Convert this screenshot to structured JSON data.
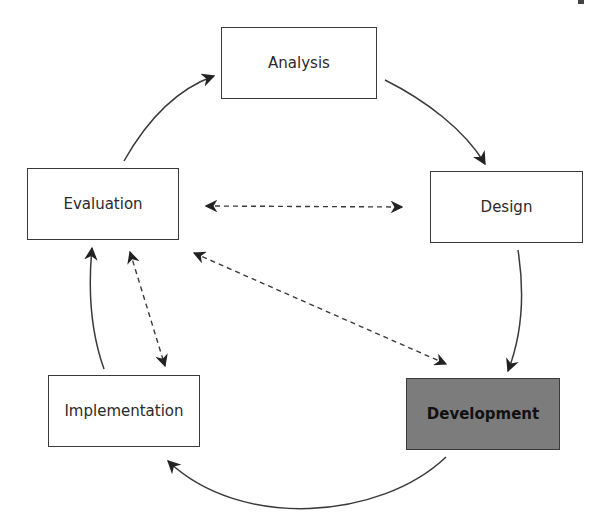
{
  "diagram": {
    "type": "cycle",
    "nodes": [
      {
        "id": "analysis",
        "label": "Analysis",
        "highlighted": false
      },
      {
        "id": "design",
        "label": "Design",
        "highlighted": false
      },
      {
        "id": "development",
        "label": "Development",
        "highlighted": true
      },
      {
        "id": "implementation",
        "label": "Implementation",
        "highlighted": false
      },
      {
        "id": "evaluation",
        "label": "Evaluation",
        "highlighted": false
      }
    ],
    "cycle_edges": [
      {
        "from": "analysis",
        "to": "design",
        "style": "solid"
      },
      {
        "from": "design",
        "to": "development",
        "style": "solid"
      },
      {
        "from": "development",
        "to": "implementation",
        "style": "solid"
      },
      {
        "from": "implementation",
        "to": "evaluation",
        "style": "solid"
      },
      {
        "from": "evaluation",
        "to": "analysis",
        "style": "solid"
      }
    ],
    "feedback_edges": [
      {
        "between": [
          "evaluation",
          "design"
        ],
        "style": "dashed",
        "bidirectional": true
      },
      {
        "between": [
          "evaluation",
          "development"
        ],
        "style": "dashed",
        "bidirectional": true
      },
      {
        "between": [
          "evaluation",
          "implementation"
        ],
        "style": "dashed",
        "bidirectional": true
      }
    ],
    "colors": {
      "line": "#3a3a3a",
      "highlight_fill": "#7c7c7c",
      "box_fill": "#ffffff"
    }
  }
}
